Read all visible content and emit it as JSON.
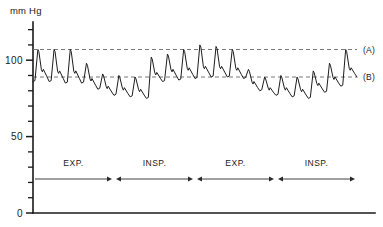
{
  "figure": {
    "unit_label": "mm Hg",
    "background_color": "#ffffff",
    "trace_color": "#1d1d1d",
    "reference_line_color": "#6a6a6a",
    "axis_color": "#1a1a1a"
  },
  "y_axis": {
    "labels": [
      {
        "value": 100,
        "text": "100"
      },
      {
        "value": 50,
        "text": "50"
      },
      {
        "value": 0,
        "text": "0"
      }
    ],
    "tick_values": [
      0,
      10,
      20,
      30,
      40,
      50,
      60,
      70,
      80,
      90,
      100,
      110,
      120
    ],
    "range": [
      0,
      125
    ]
  },
  "reference_lines": [
    {
      "id": "A",
      "label": "(A)",
      "value": 107,
      "style": "dashed"
    },
    {
      "id": "B",
      "label": "(B)",
      "value": 89,
      "style": "dashed"
    }
  ],
  "phase_markers": [
    {
      "label": "EXP.",
      "arrow": "right",
      "start_index": 0,
      "end_index": 5
    },
    {
      "label": "INSP.",
      "arrow": "both",
      "start_index": 5,
      "end_index": 10
    },
    {
      "label": "EXP.",
      "arrow": "both",
      "start_index": 10,
      "end_index": 15
    },
    {
      "label": "INSP.",
      "arrow": "both",
      "start_index": 15,
      "end_index": 20
    }
  ],
  "chart_data": {
    "type": "line",
    "title": "",
    "subtitle": "",
    "xlabel": "",
    "ylabel": "mm Hg",
    "ylim": [
      0,
      125
    ],
    "xlim": [
      0,
      20
    ],
    "grid": false,
    "legend_position": "right",
    "annotations": [
      {
        "text": "(A)",
        "y": 107,
        "note": "maximal systolic pressure during expiration"
      },
      {
        "text": "(B)",
        "y": 89,
        "note": "maximal systolic pressure during inspiration"
      },
      {
        "text": "EXP."
      },
      {
        "text": "INSP."
      }
    ],
    "series": [
      {
        "name": "Arterial pressure",
        "units": "mm Hg",
        "description": "Arterial blood pressure tracing demonstrating pulsus paradoxus; systolic peaks fall during inspiration and rise during expiration",
        "beats": [
          {
            "index": 0,
            "systolic": 107,
            "diastolic": 86,
            "notch": 95,
            "phase": "EXP"
          },
          {
            "index": 1,
            "systolic": 107,
            "diastolic": 85,
            "notch": 94,
            "phase": "EXP"
          },
          {
            "index": 2,
            "systolic": 107,
            "diastolic": 85,
            "notch": 94,
            "phase": "EXP"
          },
          {
            "index": 3,
            "systolic": 98,
            "diastolic": 81,
            "notch": 89,
            "phase": "EXP"
          },
          {
            "index": 4,
            "systolic": 91,
            "diastolic": 77,
            "notch": 84,
            "phase": "EXP"
          },
          {
            "index": 5,
            "systolic": 90,
            "diastolic": 76,
            "notch": 83,
            "phase": "INSP"
          },
          {
            "index": 6,
            "systolic": 89,
            "diastolic": 75,
            "notch": 82,
            "phase": "INSP"
          },
          {
            "index": 7,
            "systolic": 102,
            "diastolic": 86,
            "notch": 93,
            "phase": "INSP"
          },
          {
            "index": 8,
            "systolic": 104,
            "diastolic": 87,
            "notch": 95,
            "phase": "INSP"
          },
          {
            "index": 9,
            "systolic": 107,
            "diastolic": 88,
            "notch": 96,
            "phase": "INSP"
          },
          {
            "index": 10,
            "systolic": 110,
            "diastolic": 89,
            "notch": 97,
            "phase": "EXP"
          },
          {
            "index": 11,
            "systolic": 109,
            "diastolic": 89,
            "notch": 97,
            "phase": "EXP"
          },
          {
            "index": 12,
            "systolic": 107,
            "diastolic": 88,
            "notch": 96,
            "phase": "EXP"
          },
          {
            "index": 13,
            "systolic": 94,
            "diastolic": 80,
            "notch": 87,
            "phase": "EXP"
          },
          {
            "index": 14,
            "systolic": 89,
            "diastolic": 77,
            "notch": 83,
            "phase": "EXP"
          },
          {
            "index": 15,
            "systolic": 90,
            "diastolic": 76,
            "notch": 83,
            "phase": "INSP"
          },
          {
            "index": 16,
            "systolic": 89,
            "diastolic": 75,
            "notch": 82,
            "phase": "INSP"
          },
          {
            "index": 17,
            "systolic": 93,
            "diastolic": 79,
            "notch": 86,
            "phase": "INSP"
          },
          {
            "index": 18,
            "systolic": 98,
            "diastolic": 83,
            "notch": 90,
            "phase": "INSP"
          },
          {
            "index": 19,
            "systolic": 107,
            "diastolic": 89,
            "notch": 96,
            "phase": "INSP"
          }
        ]
      }
    ]
  }
}
